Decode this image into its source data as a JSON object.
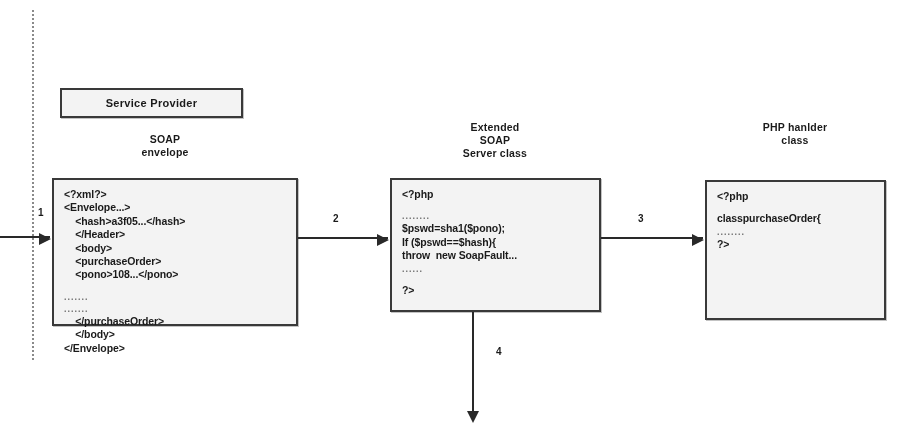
{
  "diagram": {
    "boundary": {
      "name": "service-provider-boundary"
    },
    "provider_box": {
      "label": "Service Provider"
    },
    "captions": [
      {
        "id": "soap-envelope",
        "lines": [
          "SOAP",
          "envelope"
        ]
      },
      {
        "id": "extended-soap-server-class",
        "lines": [
          "Extended",
          "SOAP",
          "Server class"
        ]
      },
      {
        "id": "php-handler-class",
        "lines": [
          "PHP hanlder",
          "class"
        ]
      }
    ],
    "boxes": [
      {
        "id": "soap-envelope-box",
        "lines": [
          {
            "text": "<?xml?>",
            "style": "code"
          },
          {
            "text": "<Envelope...>",
            "style": "code"
          },
          {
            "text": "    <hash>a3f05...</hash>",
            "style": "code"
          },
          {
            "text": "    </Header>",
            "style": "code"
          },
          {
            "text": "    <body>",
            "style": "code"
          },
          {
            "text": "    <purchaseOrder>",
            "style": "code"
          },
          {
            "text": "    <pono>108...</pono>",
            "style": "code"
          },
          {
            "text": "",
            "style": "spacer"
          },
          {
            "text": ".......",
            "style": "dots"
          },
          {
            "text": ".......",
            "style": "dots"
          },
          {
            "text": "    </purchaseOrder>",
            "style": "code"
          },
          {
            "text": "    </body>",
            "style": "code"
          },
          {
            "text": "</Envelope>",
            "style": "code"
          }
        ]
      },
      {
        "id": "extended-soap-server-box",
        "lines": [
          {
            "text": "<?php",
            "style": "code"
          },
          {
            "text": "",
            "style": "spacer"
          },
          {
            "text": "........",
            "style": "dots"
          },
          {
            "text": "$pswd=sha1($pono);",
            "style": "code"
          },
          {
            "text": "If ($pswd==$hash){",
            "style": "code"
          },
          {
            "text": "throw  new SoapFault...",
            "style": "code"
          },
          {
            "text": "......",
            "style": "dots"
          },
          {
            "text": "",
            "style": "spacer"
          },
          {
            "text": "?>",
            "style": "code"
          }
        ]
      },
      {
        "id": "php-handler-box",
        "lines": [
          {
            "text": "<?php",
            "style": "code"
          },
          {
            "text": "",
            "style": "spacer"
          },
          {
            "text": "classpurchaseOrder{",
            "style": "code"
          },
          {
            "text": "........",
            "style": "dots"
          },
          {
            "text": "?>",
            "style": "code"
          }
        ]
      }
    ],
    "arrows": [
      {
        "id": "arrow-1",
        "label": "1",
        "direction": "right"
      },
      {
        "id": "arrow-2",
        "label": "2",
        "direction": "right"
      },
      {
        "id": "arrow-3",
        "label": "3",
        "direction": "right"
      },
      {
        "id": "arrow-4",
        "label": "4",
        "direction": "down"
      }
    ],
    "colors": {
      "box_fill": "#f1f1f1",
      "box_border": "#3a3a3a",
      "arrow": "#2b2b2b",
      "text": "#1c1c1c",
      "dots": "#707070",
      "boundary": "#8a8a8a"
    }
  }
}
